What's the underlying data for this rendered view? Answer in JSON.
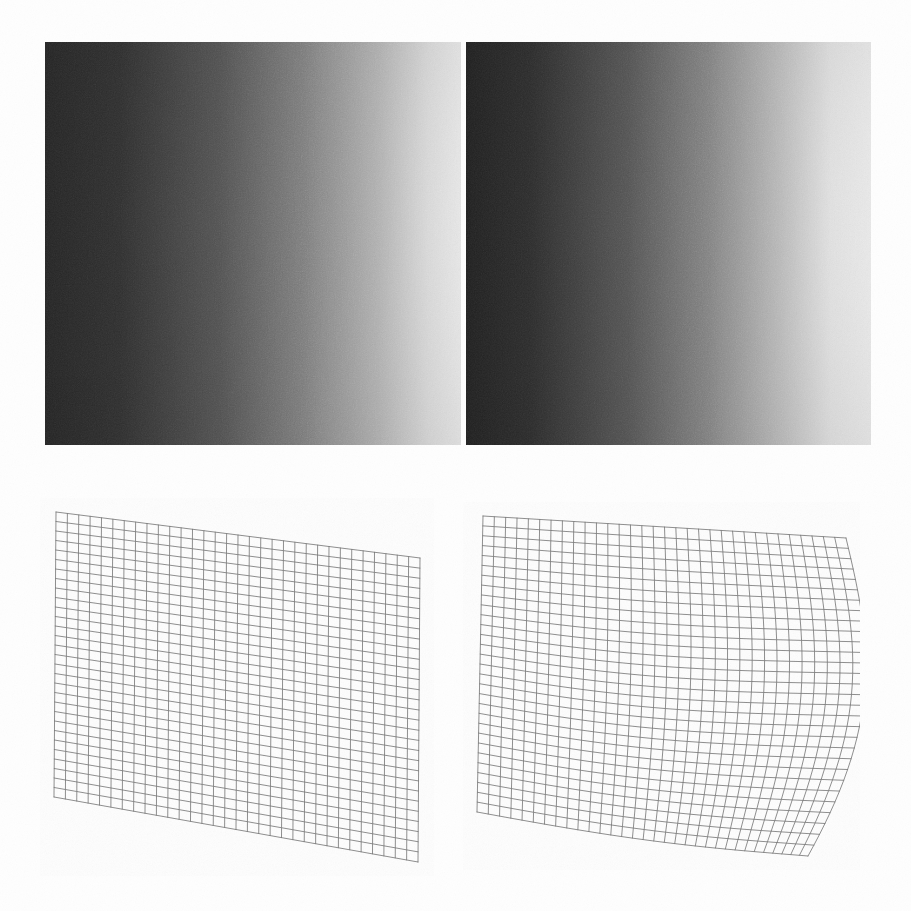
{
  "figure": {
    "kind": "scanned-journal-figure",
    "panel_count": 4,
    "layout": "2x2",
    "background_color": "#fefefe",
    "caption_ghost_text": ""
  },
  "panels": [
    {
      "id": "top-left",
      "name": "shaded-image-left",
      "type": "grayscale-shaded-surface",
      "x": 45,
      "y": 42,
      "w": 416,
      "h": 403,
      "gradient_direction": "left-to-right",
      "dark_value": "#2a2a2a",
      "mid_value": "#7d7d7d",
      "light_value": "#fafafa",
      "noise": "scan-grain",
      "description": "Shaded planar patch, dark at left edge brightening toward right edge"
    },
    {
      "id": "top-right",
      "name": "shaded-image-right",
      "type": "grayscale-shaded-surface",
      "x": 466,
      "y": 42,
      "w": 405,
      "h": 403,
      "gradient_direction": "left-to-right",
      "dark_value": "#262626",
      "mid_value": "#777777",
      "light_value": "#fcfcfc",
      "noise": "scan-grain",
      "description": "Shaded curved patch, dark at left edge with bright band toward right edge"
    },
    {
      "id": "bottom-left",
      "name": "wireframe-mesh-left",
      "type": "quad-wireframe-mesh",
      "x": 54,
      "y": 510,
      "w": 370,
      "h": 355,
      "rows": 30,
      "cols": 32,
      "line_color": "#6b6b6b",
      "shape": "planar-sheared-quadrilateral",
      "corners": [
        [
          56,
          512
        ],
        [
          420,
          558
        ],
        [
          418,
          862
        ],
        [
          54,
          797
        ]
      ],
      "description": "Regular planar control mesh drawn as a sheared quadrilateral"
    },
    {
      "id": "bottom-right",
      "name": "wireframe-mesh-right",
      "type": "quad-wireframe-mesh",
      "x": 476,
      "y": 510,
      "w": 382,
      "h": 360,
      "rows": 30,
      "cols": 32,
      "line_color": "#6b6b6b",
      "shape": "warped-curved-quadrilateral",
      "corners": [
        [
          483,
          516
        ],
        [
          846,
          538
        ],
        [
          838,
          856
        ],
        [
          477,
          812
        ]
      ],
      "description": "Deformed control mesh with bulging curved right edge and rounded lower-right corner"
    }
  ],
  "chart_data": {
    "type": "heatmap",
    "title": "",
    "xlabel": "",
    "ylabel": "",
    "grid": false,
    "legend": "none",
    "series": [
      {
        "name": "shaded-image-left",
        "kind": "grayscale-gradient",
        "stops": [
          0,
          0.18,
          0.42,
          0.62,
          0.8,
          0.92,
          1.0
        ],
        "values": [
          0.14,
          0.18,
          0.32,
          0.5,
          0.72,
          0.9,
          0.98
        ]
      },
      {
        "name": "shaded-image-right",
        "kind": "grayscale-gradient",
        "stops": [
          0,
          0.16,
          0.4,
          0.6,
          0.78,
          0.9,
          1.0
        ],
        "values": [
          0.12,
          0.17,
          0.33,
          0.52,
          0.76,
          0.93,
          0.99
        ]
      },
      {
        "name": "wireframe-mesh-left",
        "kind": "mesh",
        "rows": 30,
        "cols": 32,
        "warp": 0.0
      },
      {
        "name": "wireframe-mesh-right",
        "kind": "mesh",
        "rows": 30,
        "cols": 32,
        "warp": 0.22
      }
    ]
  }
}
